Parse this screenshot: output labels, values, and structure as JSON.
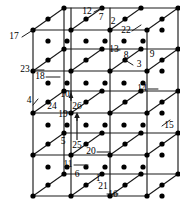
{
  "figure": {
    "type": "3d-lattice-diagram",
    "title": "",
    "colors": {
      "line": "#1a1a1a",
      "node": "#000000",
      "background": "#ffffff"
    },
    "geometry": {
      "front_face": {
        "x0": 33,
        "y0": 30,
        "x1": 147,
        "y1": 196
      },
      "depth_dx": 31,
      "depth_dy": -22,
      "cols": 4,
      "rows": 5
    },
    "node_labels": [
      {
        "id": "1",
        "text": "1",
        "x": 98,
        "y": 179
      },
      {
        "id": "2",
        "text": "2",
        "x": 113,
        "y": 22
      },
      {
        "id": "3",
        "text": "3",
        "x": 139,
        "y": 65
      },
      {
        "id": "4",
        "text": "4",
        "x": 29,
        "y": 101
      },
      {
        "id": "5",
        "text": "5",
        "x": 63,
        "y": 142
      },
      {
        "id": "6",
        "text": "6",
        "x": 77,
        "y": 175
      },
      {
        "id": "7",
        "text": "7",
        "x": 101,
        "y": 18
      },
      {
        "id": "8",
        "text": "8",
        "x": 126,
        "y": 56
      },
      {
        "id": "9",
        "text": "9",
        "x": 152,
        "y": 55
      },
      {
        "id": "10",
        "text": "10",
        "x": 65,
        "y": 95
      },
      {
        "id": "11",
        "text": "11",
        "x": 68,
        "y": 165
      },
      {
        "id": "12",
        "text": "12",
        "x": 87,
        "y": 12
      },
      {
        "id": "13",
        "text": "13",
        "x": 114,
        "y": 50
      },
      {
        "id": "14",
        "text": "14",
        "x": 142,
        "y": 89
      },
      {
        "id": "15",
        "text": "15",
        "x": 169,
        "y": 126
      },
      {
        "id": "16",
        "text": "16",
        "x": 113,
        "y": 195
      },
      {
        "id": "17",
        "text": "17",
        "x": 14,
        "y": 37
      },
      {
        "id": "18",
        "text": "18",
        "x": 40,
        "y": 77
      },
      {
        "id": "19",
        "text": "19",
        "x": 63,
        "y": 115
      },
      {
        "id": "20",
        "text": "20",
        "x": 91,
        "y": 152
      },
      {
        "id": "21",
        "text": "21",
        "x": 103,
        "y": 187
      },
      {
        "id": "22",
        "text": "22",
        "x": 126,
        "y": 31
      },
      {
        "id": "23",
        "text": "23",
        "x": 25,
        "y": 70
      },
      {
        "id": "24",
        "text": "24",
        "x": 52,
        "y": 107
      },
      {
        "id": "25",
        "text": "25",
        "x": 77,
        "y": 146
      },
      {
        "id": "26",
        "text": "26",
        "x": 77,
        "y": 107
      }
    ]
  }
}
